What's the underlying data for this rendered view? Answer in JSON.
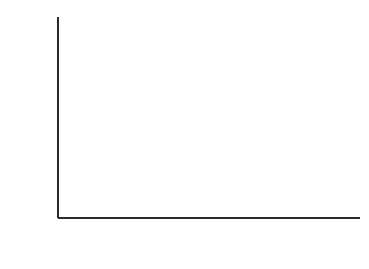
{
  "chart_data": {
    "type": "line",
    "title": "",
    "xlabel": "TIME (sec)",
    "ylabel": "E r (t)  (dynes/cm2)",
    "ylabel_parts": {
      "main": "E",
      "sub": "r",
      "mid": "(t)  (dynes/cm",
      "sup": "2",
      "end": ")"
    },
    "xscale": "log",
    "yscale": "log",
    "xlim": [
      1,
      20000
    ],
    "ylim": [
      10000000,
      10000000000
    ],
    "grid": false,
    "legend_position": "right-inline",
    "x_tick_labels": [
      "1",
      "10",
      "100",
      "1000",
      "10000"
    ],
    "x_tick_values": [
      1,
      10,
      100,
      1000,
      10000
    ],
    "y_decade_labels": [
      {
        "mantissa": "10",
        "exponent": "10",
        "value": 10000000000
      },
      {
        "mantissa": "10",
        "exponent": "9",
        "value": 1000000000
      },
      {
        "mantissa": "10",
        "exponent": "8",
        "value": 100000000
      },
      {
        "mantissa": "10",
        "exponent": "7",
        "value": 10000000
      }
    ],
    "y_minor_labels": [
      "8",
      "6",
      "4",
      "2"
    ],
    "y_minor_multipliers": [
      8,
      6,
      4,
      2
    ],
    "series": [
      {
        "name": "21°C",
        "label_main": "21",
        "label_deg": "°",
        "label_unit": "C",
        "temperature": 21,
        "x": [
          1,
          2,
          3,
          5,
          8,
          13,
          21,
          35,
          57,
          93,
          152,
          250,
          410,
          670,
          1100,
          1800,
          2950,
          4800,
          7900,
          13000,
          19000
        ],
        "y": [
          2200000000.0,
          2190000000.0,
          2180000000.0,
          2170000000.0,
          2160000000.0,
          2150000000.0,
          2140000000.0,
          2130000000.0,
          2110000000.0,
          2100000000.0,
          2080000000.0,
          2060000000.0,
          2030000000.0,
          2000000000.0,
          1970000000.0,
          1930000000.0,
          1890000000.0,
          1850000000.0,
          1810000000.0,
          1770000000.0,
          1740000000.0
        ]
      },
      {
        "name": "35°",
        "label_main": "35",
        "label_deg": "°",
        "label_unit": "",
        "temperature": 35,
        "x": [
          1,
          2,
          3,
          5,
          8,
          13,
          21,
          35,
          57,
          93,
          152,
          250,
          410,
          670,
          1100,
          1800,
          2950,
          4800,
          7900,
          13000,
          19000
        ],
        "y": [
          2080000000.0,
          2070000000.0,
          2060000000.0,
          2050000000.0,
          2030000000.0,
          2020000000.0,
          2000000000.0,
          1980000000.0,
          1960000000.0,
          1930000000.0,
          1900000000.0,
          1860000000.0,
          1820000000.0,
          1770000000.0,
          1720000000.0,
          1670000000.0,
          1620000000.0,
          1570000000.0,
          1520000000.0,
          1470000000.0,
          1440000000.0
        ]
      },
      {
        "name": "43°",
        "label_main": "43",
        "label_deg": "°",
        "label_unit": "",
        "temperature": 43,
        "x": [
          1,
          2,
          3,
          5,
          8,
          13,
          21,
          35,
          57,
          93,
          152,
          250,
          410,
          670,
          1100,
          1800,
          2950,
          4800,
          7900,
          13000,
          19000
        ],
        "y": [
          2000000000.0,
          1990000000.0,
          1980000000.0,
          1960000000.0,
          1940000000.0,
          1920000000.0,
          1890000000.0,
          1860000000.0,
          1820000000.0,
          1780000000.0,
          1730000000.0,
          1680000000.0,
          1620000000.0,
          1560000000.0,
          1500000000.0,
          1440000000.0,
          1380000000.0,
          1330000000.0,
          1280000000.0,
          1240000000.0,
          1210000000.0
        ]
      },
      {
        "name": "50°",
        "label_main": "50",
        "label_deg": "°",
        "label_unit": "",
        "temperature": 50,
        "x": [
          1,
          2,
          3,
          5,
          8,
          13,
          21,
          35,
          57,
          93,
          152,
          250,
          410,
          670,
          1100,
          1800,
          2950,
          4800,
          7900,
          13000,
          19000
        ],
        "y": [
          1950000000.0,
          1940000000.0,
          1920000000.0,
          1900000000.0,
          1870000000.0,
          1840000000.0,
          1800000000.0,
          1750000000.0,
          1700000000.0,
          1640000000.0,
          1570000000.0,
          1500000000.0,
          1430000000.0,
          1350000000.0,
          1280000000.0,
          1210000000.0,
          1150000000.0,
          1090000000.0,
          1040000000.0,
          1000000000.0,
          970000000.0
        ]
      },
      {
        "name": "60°",
        "label_main": "60",
        "label_deg": "°",
        "label_unit": "",
        "temperature": 60,
        "x": [
          1,
          2,
          3,
          5,
          8,
          13,
          21,
          35,
          57,
          93,
          152,
          250,
          410,
          670,
          1100,
          1800,
          2950,
          4800,
          7900,
          13000,
          19000
        ],
        "y": [
          1900000000.0,
          1880000000.0,
          1860000000.0,
          1830000000.0,
          1790000000.0,
          1740000000.0,
          1690000000.0,
          1620000000.0,
          1540000000.0,
          1460000000.0,
          1370000000.0,
          1280000000.0,
          1190000000.0,
          1100000000.0,
          1020000000.0,
          950000000.0,
          885000000.0,
          830000000.0,
          785000000.0,
          750000000.0,
          725000000.0
        ]
      },
      {
        "name": "70°",
        "label_main": "70",
        "label_deg": "°",
        "label_unit": "",
        "temperature": 70,
        "x": [
          1,
          2,
          3,
          5,
          8,
          13,
          21,
          35,
          57,
          93,
          152,
          250,
          410,
          670,
          1100,
          1800,
          2950,
          4800,
          7900,
          13000,
          19000
        ],
        "y": [
          1830000000.0,
          1810000000.0,
          1780000000.0,
          1740000000.0,
          1680000000.0,
          1610000000.0,
          1530000000.0,
          1440000000.0,
          1340000000.0,
          1230000000.0,
          1120000000.0,
          1010000000.0,
          910000000.0,
          820000000.0,
          740000000.0,
          675000000.0,
          620000000.0,
          575000000.0,
          540000000.0,
          515000000.0,
          500000000.0
        ]
      },
      {
        "name": "80°",
        "label_main": "80",
        "label_deg": "°",
        "label_unit": "",
        "temperature": 80,
        "x": [
          1,
          2,
          3,
          5,
          8,
          13,
          21,
          35,
          57,
          93,
          152,
          250,
          410,
          670,
          1100,
          1800,
          2950,
          4800,
          7900,
          13000,
          19000
        ],
        "y": [
          1760000000.0,
          1720000000.0,
          1680000000.0,
          1620000000.0,
          1540000000.0,
          1440000000.0,
          1330000000.0,
          1210000000.0,
          1080000000.0,
          955000000.0,
          835000000.0,
          725000000.0,
          630000000.0,
          550000000.0,
          485000000.0,
          432000000.0,
          392000000.0,
          360000000.0,
          338000000.0,
          322000000.0,
          312000000.0
        ]
      },
      {
        "name": "90°",
        "label_main": "90",
        "label_deg": "°",
        "label_unit": "",
        "temperature": 90,
        "x": [
          1,
          2,
          3,
          5,
          8,
          13,
          21,
          35,
          57,
          93,
          152,
          250,
          410,
          670,
          1100,
          1800,
          2950,
          4800,
          7900,
          13000,
          19000
        ],
        "y": [
          1700000000.0,
          1640000000.0,
          1580000000.0,
          1490000000.0,
          1370000000.0,
          1240000000.0,
          1100000000.0,
          955000000.0,
          815000000.0,
          685000000.0,
          570000000.0,
          472000000.0,
          392000000.0,
          328000000.0,
          278000000.0,
          240000000.0,
          212000000.0,
          192000000.0,
          178000000.0,
          168000000.0,
          162000000.0
        ]
      },
      {
        "name": "96°",
        "label_main": "96",
        "label_deg": "°",
        "label_unit": "",
        "temperature": 96,
        "x": [
          1,
          2,
          3,
          5,
          8,
          13,
          21,
          35,
          57,
          93,
          152,
          250,
          410,
          670,
          1100,
          1800,
          2950,
          4800,
          7900,
          13000,
          19000
        ],
        "y": [
          1620000000.0,
          1540000000.0,
          1460000000.0,
          1340000000.0,
          1190000000.0,
          1040000000.0,
          885000000.0,
          735000000.0,
          600000000.0,
          482000000.0,
          383000000.0,
          302000000.0,
          240000000.0,
          193000000.0,
          158000000.0,
          132000000.0,
          114000000.0,
          101000000.0,
          92000000.0,
          86000000.0,
          82500000.0
        ]
      }
    ]
  },
  "colors": {
    "axis": "#2b2b2b",
    "curve": "#181818",
    "background": "#ffffff"
  }
}
